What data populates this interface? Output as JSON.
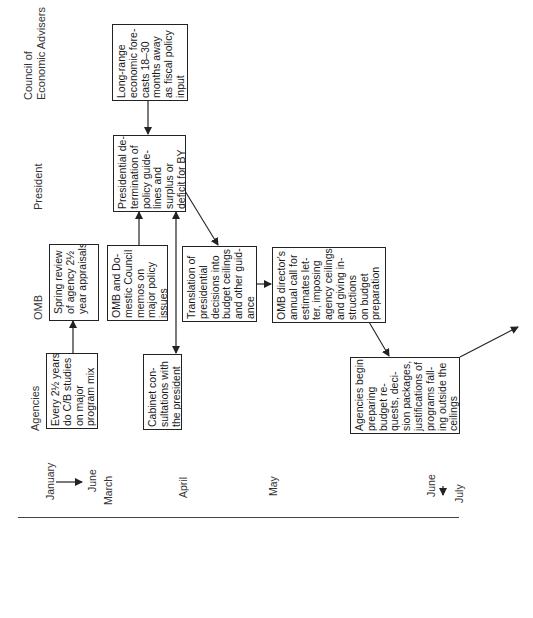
{
  "rows": {
    "cea": "Council of\nEconomic Advisers",
    "president": "President",
    "omb": "OMB",
    "agencies": "Agencies"
  },
  "boxes": {
    "cea_forecasts": "Long-range\neconomic fore-\ncasts 18–30\nmonths away\nas fiscal policy\ninput",
    "president_determination": "Presidential de-\ntermination of\npolicy guide-\nlines and\nsurplus or\ndeficit for BY",
    "omb_spring_review": "Spring review\nof agency 2½\nyear appraisals",
    "omb_domestic_council": "OMB and Do-\nmestic Council\nmemos on\nmajor policy\nissues",
    "omb_translation": "Translation of\npresidential\ndecisions into\nbudget ceilings\nand other guid-\nance",
    "omb_director_call": "OMB director's\nannual call for\nestimates let-\nter, imposing\nagency ceilings\nand giving in-\nstructions\non budget\npreparation",
    "agencies_cb_studies": "Every 2½ years,\ndo C/B studies\non major\nprogram mix",
    "agencies_cabinet": "Cabinet con-\nsultations with\nthe president",
    "agencies_begin": "Agencies begin\npreparing\nbudget re-\nquests, deci-\nsion packages,\njustifications of\nprograms fall-\ning outside the\nceilings"
  },
  "timeline": {
    "january": "January",
    "june_1": "June",
    "march": "March",
    "april": "April",
    "may": "May",
    "june_2": "June",
    "july": "July"
  },
  "colors": {
    "line": "#222222",
    "text": "#1a1a1a"
  }
}
